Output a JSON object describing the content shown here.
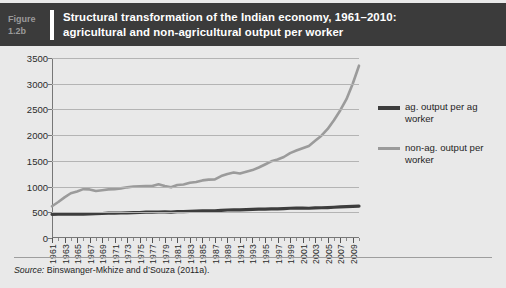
{
  "figure": {
    "label_word": "Figure",
    "label_number": "1.2b",
    "title_line1": "Structural transformation of the Indian economy, 1961–2010:",
    "title_line2": "agricultural and non-agricultural output per worker",
    "header_bg": "#3b3b3b",
    "panel_bg": "#e9e9e9"
  },
  "source": {
    "prefix": "Source:",
    "text": " Binswanger-Mkhize and d’Souza (2011a)."
  },
  "legend": {
    "entries": [
      {
        "label": "ag. output per ag worker",
        "color": "#3d3d3d",
        "style": "thick"
      },
      {
        "label": "non-ag. output per worker",
        "color": "#9b9b9b",
        "style": "thin"
      }
    ]
  },
  "chart_data": {
    "type": "line",
    "title": "Structural transformation of the Indian economy, 1961–2010: agricultural and non-agricultural output per worker",
    "xlabel": "",
    "ylabel": "",
    "xlim": [
      1961,
      2010
    ],
    "ylim": [
      0,
      3500
    ],
    "yticks": [
      0,
      500,
      1000,
      1500,
      2000,
      2500,
      3000,
      3500
    ],
    "ytick_labels": [
      "0",
      "500",
      "1000",
      "1500",
      "2000",
      "2500",
      "3000",
      "3500"
    ],
    "grid": "horizontal",
    "legend_position": "right",
    "x": [
      1961,
      1962,
      1963,
      1964,
      1965,
      1966,
      1967,
      1968,
      1969,
      1970,
      1971,
      1972,
      1973,
      1974,
      1975,
      1976,
      1977,
      1978,
      1979,
      1980,
      1981,
      1982,
      1983,
      1984,
      1985,
      1986,
      1987,
      1988,
      1989,
      1990,
      1991,
      1992,
      1993,
      1994,
      1995,
      1996,
      1997,
      1998,
      1999,
      2000,
      2001,
      2002,
      2003,
      2004,
      2005,
      2006,
      2007,
      2008,
      2009,
      2010
    ],
    "xtick_labels": [
      "1961",
      "1963",
      "1965",
      "1967",
      "1969",
      "1971",
      "1973",
      "1975",
      "1977",
      "1979",
      "1981",
      "1983",
      "1985",
      "1987",
      "1989",
      "1991",
      "1993",
      "1995",
      "1997",
      "1999",
      "2001",
      "2003",
      "2005",
      "2007",
      "2009"
    ],
    "series": [
      {
        "name": "ag. output per ag worker",
        "color": "#3d3d3d",
        "width": 3.2,
        "values": [
          460,
          462,
          464,
          470,
          466,
          462,
          468,
          472,
          476,
          482,
          484,
          486,
          490,
          492,
          496,
          502,
          504,
          506,
          508,
          504,
          512,
          514,
          518,
          522,
          526,
          530,
          530,
          538,
          544,
          548,
          548,
          552,
          556,
          560,
          562,
          566,
          568,
          572,
          578,
          580,
          580,
          578,
          586,
          588,
          592,
          598,
          604,
          610,
          614,
          620
        ]
      },
      {
        "name": "non-ag. output per worker",
        "color": "#9b9b9b",
        "width": 2.6,
        "values": [
          618,
          700,
          790,
          870,
          905,
          950,
          945,
          915,
          930,
          945,
          950,
          965,
          985,
          1000,
          1005,
          1010,
          1010,
          1045,
          1010,
          985,
          1030,
          1040,
          1075,
          1090,
          1120,
          1135,
          1140,
          1205,
          1245,
          1275,
          1255,
          1290,
          1320,
          1370,
          1430,
          1490,
          1525,
          1575,
          1650,
          1700,
          1745,
          1790,
          1890,
          1990,
          2120,
          2290,
          2480,
          2700,
          3000,
          3350
        ]
      }
    ]
  }
}
